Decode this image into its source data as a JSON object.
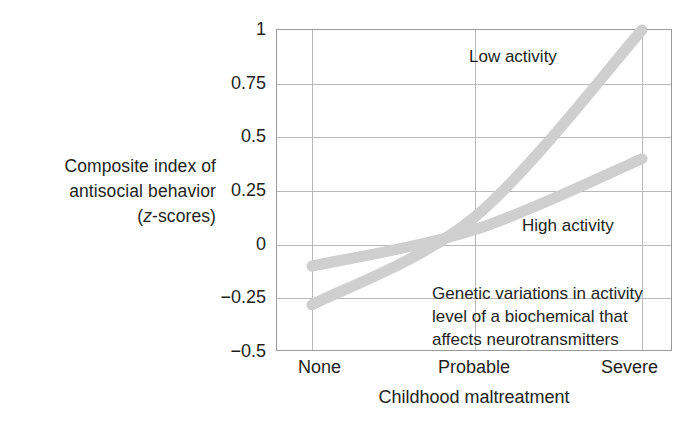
{
  "chart_data": {
    "type": "line",
    "title": "",
    "xlabel": "Childhood maltreatment",
    "ylabel": "Composite index of antisocial behavior (z-scores)",
    "ylabel_lines": [
      "Composite index of",
      "antisocial behavior",
      "(z-scores)"
    ],
    "categories": [
      "None",
      "Probable",
      "Severe"
    ],
    "x_tick_labels": [
      "None",
      "Probable",
      "Severe"
    ],
    "y_tick_labels": [
      "1",
      "0.75",
      "0.5",
      "0.25",
      "0",
      "−0.25",
      "−0.5"
    ],
    "y_tick_values": [
      1,
      0.75,
      0.5,
      0.25,
      0,
      -0.25,
      -0.5
    ],
    "ylim": [
      -0.5,
      1
    ],
    "xlim": [
      0,
      2
    ],
    "grid": "both",
    "legend_position": "in-plot-annotations",
    "series": [
      {
        "name": "Low activity",
        "values": [
          -0.28,
          0.13,
          1.0
        ],
        "color": "#cfcfcf",
        "label": "Low activity",
        "curvature": "convex-increasing"
      },
      {
        "name": "High activity",
        "values": [
          -0.1,
          0.07,
          0.4
        ],
        "color": "#cfcfcf",
        "label": "High activity",
        "curvature": "slightly-concave-increasing"
      }
    ],
    "annotations": [
      {
        "id": "low-activity-label",
        "text": "Low activity"
      },
      {
        "id": "high-activity-label",
        "text": "High activity"
      },
      {
        "id": "explanatory-note",
        "text": "Genetic variations in activity level of a biochemical that affects neurotransmitters",
        "lines": [
          "Genetic variations in activity",
          "level of a biochemical that",
          "affects neurotransmitters"
        ]
      }
    ],
    "colors": {
      "series_line": "#cfcfcf",
      "grid": "#b9b9b9",
      "frame": "#9a9a9a",
      "text": "#231f20",
      "background": "#ffffff"
    }
  },
  "axes": {
    "y_title_line1": "Composite index of",
    "y_title_line2": "antisocial behavior",
    "y_title_line3_open": "(",
    "y_title_line3_ital": "z",
    "y_title_line3_rest": "-scores)",
    "x_title": "Childhood maltreatment"
  },
  "y_ticks": [
    {
      "label": "1",
      "value": 1
    },
    {
      "label": "0.75",
      "value": 0.75
    },
    {
      "label": "0.5",
      "value": 0.5
    },
    {
      "label": "0.25",
      "value": 0.25
    },
    {
      "label": "0",
      "value": 0
    },
    {
      "label": "−0.25",
      "value": -0.25
    },
    {
      "label": "−0.5",
      "value": -0.5
    }
  ],
  "x_ticks": [
    {
      "label": "None",
      "value": 0
    },
    {
      "label": "Probable",
      "value": 1
    },
    {
      "label": "Severe",
      "value": 2
    }
  ],
  "annotations": {
    "low_activity": "Low activity",
    "high_activity": "High activity",
    "note_line1": "Genetic variations in activity",
    "note_line2": "level of a biochemical that",
    "note_line3": "affects neurotransmitters"
  }
}
